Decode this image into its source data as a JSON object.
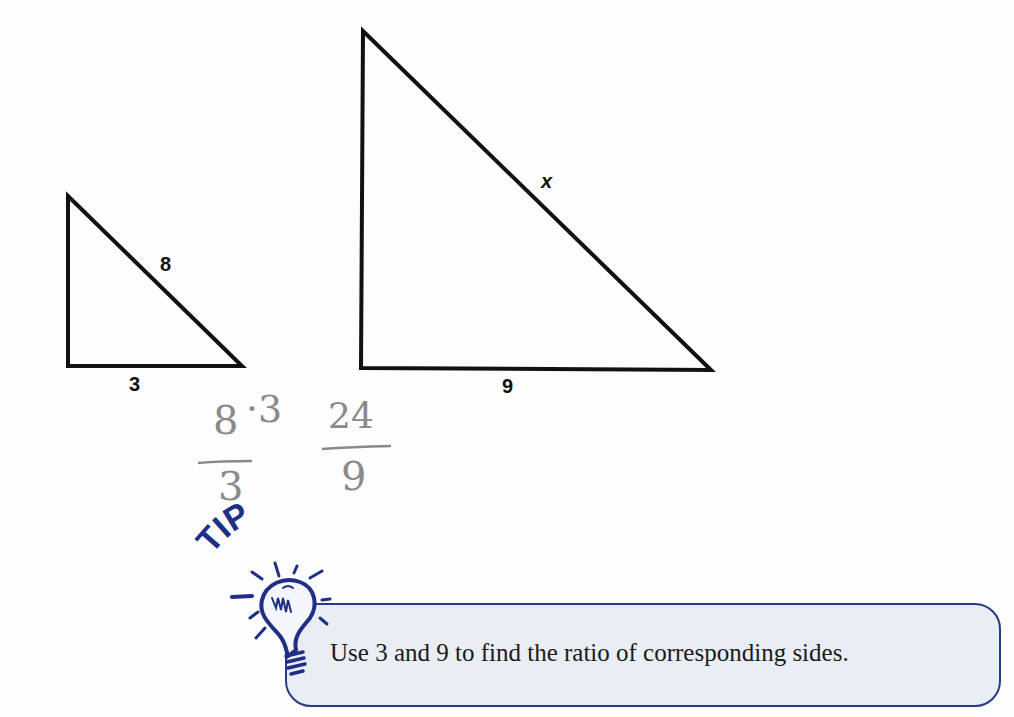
{
  "diagram": {
    "small_triangle": {
      "side_labels": {
        "hypotenuse": "8",
        "base": "3"
      }
    },
    "large_triangle": {
      "side_labels": {
        "hypotenuse": "x",
        "base": "9"
      }
    },
    "handwritten_work": {
      "numerator_left": "8",
      "multiplier": "·3",
      "denominator_left": "3",
      "numerator_right": "24",
      "denominator_right": "9"
    },
    "tip": {
      "badge": "TIP",
      "text": "Use 3 and 9 to find the ratio of corresponding sides."
    },
    "colors": {
      "outline": "#111111",
      "tip_navy": "#2b3a86",
      "tip_fill": "#e9edf4",
      "pencil": "#8a8a8a"
    }
  }
}
